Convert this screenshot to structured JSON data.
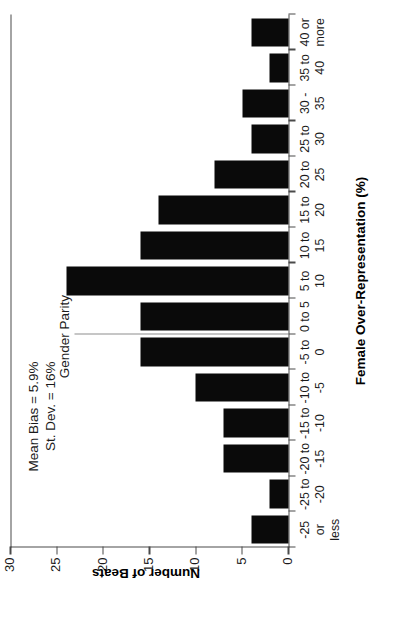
{
  "chart_data": {
    "type": "bar",
    "title": "",
    "xlabel": "Female Over-Representation (%)",
    "ylabel": "Number of Beats",
    "ylim": [
      0,
      30
    ],
    "ytick_values": [
      0,
      5,
      10,
      15,
      20,
      25,
      30
    ],
    "ytick_labels": [
      "0",
      "5",
      "10",
      "15",
      "20",
      "25",
      "30"
    ],
    "grid": false,
    "legend": null,
    "bar_color": "#0a0a0a",
    "axis_color": "#4a4a4a",
    "categories": [
      "-25 or less",
      "-25 to -20",
      "-20 to -15",
      "-15 to -10",
      "-10 to -5",
      "-5 to 0",
      "0 to 5",
      "5 to 10",
      "10 to 15",
      "15 to 20",
      "20 to 25",
      "25 to 30",
      "30 - 35",
      "35 to 40",
      "40 or more"
    ],
    "category_label_lines": [
      [
        "-25",
        "or",
        "less"
      ],
      [
        "-25 to",
        "-20"
      ],
      [
        "-20 to",
        "-15"
      ],
      [
        "-15 to",
        "-10"
      ],
      [
        "-10 to",
        "-5"
      ],
      [
        "-5 to",
        "0"
      ],
      [
        "0 to 5"
      ],
      [
        "5 to",
        "10"
      ],
      [
        "10 to",
        "15"
      ],
      [
        "15 to",
        "20"
      ],
      [
        "20 to",
        "25"
      ],
      [
        "25 to",
        "30"
      ],
      [
        "30 -",
        "35"
      ],
      [
        "35 to",
        "40"
      ],
      [
        "40 or",
        "more"
      ]
    ],
    "values": [
      4,
      2,
      7,
      7,
      10,
      16,
      16,
      24,
      16,
      14,
      8,
      4,
      5,
      2,
      4
    ],
    "annotations": [
      {
        "name": "mean-bias",
        "text": "Mean Bias = 5.9%"
      },
      {
        "name": "std-dev",
        "text": "St. Dev. = 16%"
      },
      {
        "name": "gender-parity",
        "text": "Gender Parity"
      }
    ]
  },
  "annotations": {
    "mean_bias": "Mean Bias = 5.9%",
    "st_dev": "St. Dev. = 16%",
    "gender_parity": "Gender Parity"
  },
  "axes": {
    "x_title": "Female Over-Representation (%)",
    "y_title": "Number of Beats"
  }
}
